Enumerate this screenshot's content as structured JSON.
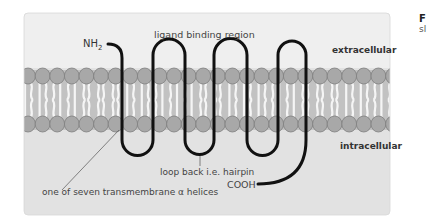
{
  "diagram": {
    "type": "G-protein coupled receptor in cell membrane",
    "labels": {
      "n_terminus": "NH",
      "n_terminus_sub": "2",
      "ligand_region": "ligand binding region",
      "extracellular": "extracellular",
      "intracellular": "intracellular",
      "loop_back": "loop back i.e. hairpin",
      "c_terminus": "COOH",
      "helices": "one of seven transmembrane α helices"
    },
    "helix_count": 7,
    "colors": {
      "panel_bg": "#e4e4e4",
      "extracellular_bg": "#ececec",
      "membrane_core": "#c4c4c4",
      "lipid_head": "#a9a9a9",
      "lipid_outline": "#808080",
      "protein_chain": "#111111",
      "label_text": "#333333"
    }
  },
  "side_caption": {
    "line1": "F",
    "line2": "sl"
  }
}
